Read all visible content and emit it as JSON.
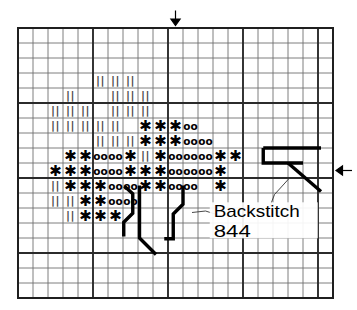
{
  "chart_data": {
    "type": "table",
    "grid": {
      "columns": 21,
      "rows": 18,
      "cell_size_px": 15,
      "origin_x_px": 18,
      "origin_y_px": 28,
      "thick_line_every": 5,
      "thin_line_color": "#6f6f6f",
      "thick_line_color": "#2b2b2b",
      "border_color": "#1f1f1f"
    },
    "symbols": [
      {
        "key": "bars",
        "glyph": "||",
        "name": "double-bar-symbol",
        "color": "#4a4a4a"
      },
      {
        "key": "star",
        "glyph": "✱",
        "name": "asterisk-symbol",
        "color": "#000000"
      },
      {
        "key": "circ",
        "glyph": "oo",
        "name": "double-o-symbol",
        "color": "#000000"
      }
    ],
    "cells": [
      {
        "row": 3,
        "col": 5,
        "sym": "bars"
      },
      {
        "row": 3,
        "col": 6,
        "sym": "bars"
      },
      {
        "row": 3,
        "col": 7,
        "sym": "bars"
      },
      {
        "row": 4,
        "col": 3,
        "sym": "bars"
      },
      {
        "row": 4,
        "col": 6,
        "sym": "bars"
      },
      {
        "row": 4,
        "col": 7,
        "sym": "bars"
      },
      {
        "row": 4,
        "col": 8,
        "sym": "bars"
      },
      {
        "row": 5,
        "col": 2,
        "sym": "bars"
      },
      {
        "row": 5,
        "col": 3,
        "sym": "bars"
      },
      {
        "row": 5,
        "col": 4,
        "sym": "bars"
      },
      {
        "row": 5,
        "col": 6,
        "sym": "bars"
      },
      {
        "row": 5,
        "col": 7,
        "sym": "bars"
      },
      {
        "row": 5,
        "col": 8,
        "sym": "bars"
      },
      {
        "row": 6,
        "col": 2,
        "sym": "bars"
      },
      {
        "row": 6,
        "col": 3,
        "sym": "bars"
      },
      {
        "row": 6,
        "col": 4,
        "sym": "bars"
      },
      {
        "row": 6,
        "col": 5,
        "sym": "bars"
      },
      {
        "row": 6,
        "col": 6,
        "sym": "bars"
      },
      {
        "row": 6,
        "col": 8,
        "sym": "star"
      },
      {
        "row": 6,
        "col": 9,
        "sym": "star"
      },
      {
        "row": 6,
        "col": 10,
        "sym": "star"
      },
      {
        "row": 6,
        "col": 11,
        "sym": "circ"
      },
      {
        "row": 7,
        "col": 5,
        "sym": "bars"
      },
      {
        "row": 7,
        "col": 6,
        "sym": "bars"
      },
      {
        "row": 7,
        "col": 7,
        "sym": "bars"
      },
      {
        "row": 7,
        "col": 8,
        "sym": "star"
      },
      {
        "row": 7,
        "col": 9,
        "sym": "star"
      },
      {
        "row": 7,
        "col": 10,
        "sym": "star"
      },
      {
        "row": 7,
        "col": 11,
        "sym": "circ"
      },
      {
        "row": 7,
        "col": 12,
        "sym": "circ"
      },
      {
        "row": 8,
        "col": 3,
        "sym": "star"
      },
      {
        "row": 8,
        "col": 4,
        "sym": "star"
      },
      {
        "row": 8,
        "col": 5,
        "sym": "circ"
      },
      {
        "row": 8,
        "col": 6,
        "sym": "circ"
      },
      {
        "row": 8,
        "col": 7,
        "sym": "star"
      },
      {
        "row": 8,
        "col": 8,
        "sym": "bars"
      },
      {
        "row": 8,
        "col": 9,
        "sym": "star"
      },
      {
        "row": 8,
        "col": 10,
        "sym": "circ"
      },
      {
        "row": 8,
        "col": 11,
        "sym": "circ"
      },
      {
        "row": 8,
        "col": 12,
        "sym": "circ"
      },
      {
        "row": 8,
        "col": 13,
        "sym": "star"
      },
      {
        "row": 8,
        "col": 14,
        "sym": "star"
      },
      {
        "row": 9,
        "col": 2,
        "sym": "star"
      },
      {
        "row": 9,
        "col": 3,
        "sym": "star"
      },
      {
        "row": 9,
        "col": 4,
        "sym": "star"
      },
      {
        "row": 9,
        "col": 5,
        "sym": "circ"
      },
      {
        "row": 9,
        "col": 6,
        "sym": "circ"
      },
      {
        "row": 9,
        "col": 7,
        "sym": "star"
      },
      {
        "row": 9,
        "col": 8,
        "sym": "star"
      },
      {
        "row": 9,
        "col": 9,
        "sym": "star"
      },
      {
        "row": 9,
        "col": 10,
        "sym": "circ"
      },
      {
        "row": 9,
        "col": 11,
        "sym": "circ"
      },
      {
        "row": 9,
        "col": 12,
        "sym": "circ"
      },
      {
        "row": 9,
        "col": 13,
        "sym": "star"
      },
      {
        "row": 10,
        "col": 2,
        "sym": "bars"
      },
      {
        "row": 10,
        "col": 3,
        "sym": "star"
      },
      {
        "row": 10,
        "col": 4,
        "sym": "star"
      },
      {
        "row": 10,
        "col": 5,
        "sym": "star"
      },
      {
        "row": 10,
        "col": 6,
        "sym": "circ"
      },
      {
        "row": 10,
        "col": 7,
        "sym": "circ"
      },
      {
        "row": 10,
        "col": 8,
        "sym": "star"
      },
      {
        "row": 10,
        "col": 9,
        "sym": "star"
      },
      {
        "row": 10,
        "col": 10,
        "sym": "circ"
      },
      {
        "row": 10,
        "col": 11,
        "sym": "circ"
      },
      {
        "row": 10,
        "col": 13,
        "sym": "star"
      },
      {
        "row": 11,
        "col": 2,
        "sym": "bars"
      },
      {
        "row": 11,
        "col": 3,
        "sym": "bars"
      },
      {
        "row": 11,
        "col": 4,
        "sym": "star"
      },
      {
        "row": 11,
        "col": 5,
        "sym": "star"
      },
      {
        "row": 11,
        "col": 6,
        "sym": "circ"
      },
      {
        "row": 11,
        "col": 7,
        "sym": "circ"
      },
      {
        "row": 12,
        "col": 3,
        "sym": "bars"
      },
      {
        "row": 12,
        "col": 4,
        "sym": "star"
      },
      {
        "row": 12,
        "col": 5,
        "sym": "star"
      },
      {
        "row": 12,
        "col": 6,
        "sym": "star"
      }
    ],
    "backstitch_paths": [
      {
        "name": "stem-left-lower",
        "points": [
          [
            7.05,
            13.9
          ],
          [
            7.05,
            12.95
          ],
          [
            7.65,
            12.35
          ],
          [
            7.65,
            11.05
          ],
          [
            7.1,
            10.55
          ]
        ]
      },
      {
        "name": "stem-center-diagonal",
        "points": [
          [
            9.2,
            15.1
          ],
          [
            8.1,
            14.0
          ],
          [
            8.1,
            12.35
          ],
          [
            8.1,
            10.5
          ]
        ]
      },
      {
        "name": "stem-right-branch",
        "points": [
          [
            9.75,
            14.05
          ],
          [
            10.35,
            14.05
          ],
          [
            10.35,
            12.4
          ],
          [
            11.0,
            11.75
          ],
          [
            11.0,
            10.5
          ]
        ]
      },
      {
        "name": "hook-upper-right",
        "points": [
          [
            16.35,
            8.0
          ],
          [
            20.2,
            8.0
          ]
        ]
      },
      {
        "name": "hook-mid-right",
        "points": [
          [
            16.35,
            8.0
          ],
          [
            16.35,
            9.0
          ],
          [
            19.0,
            9.0
          ]
        ]
      },
      {
        "name": "hook-diagonal-right",
        "points": [
          [
            18.0,
            9.0
          ],
          [
            20.2,
            10.9
          ]
        ]
      }
    ],
    "leader_lines": [
      {
        "name": "leader-to-left-backstitch",
        "points": [
          [
            13.3,
            12.45
          ],
          [
            12.5,
            12.2
          ],
          [
            11.6,
            12.3
          ]
        ]
      },
      {
        "name": "leader-to-right-backstitch",
        "points": [
          [
            16.6,
            12.4
          ],
          [
            17.1,
            11.1
          ],
          [
            18.1,
            10.0
          ]
        ]
      }
    ],
    "legend": {
      "title": "Backstitch",
      "code": "844"
    },
    "markers": [
      {
        "name": "center-marker-top",
        "direction": "down",
        "axis": "column",
        "index": 10
      },
      {
        "name": "center-marker-right",
        "direction": "left",
        "axis": "row",
        "index": 9
      }
    ]
  }
}
